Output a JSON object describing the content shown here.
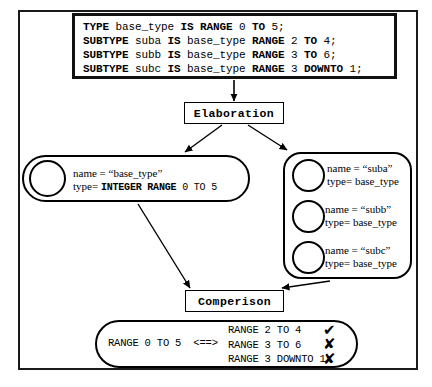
{
  "code_box": {
    "lines": [
      [
        {
          "t": "TYPE ",
          "b": true
        },
        {
          "t": "base_type ",
          "b": false
        },
        {
          "t": "IS RANGE ",
          "b": true
        },
        {
          "t": "0 ",
          "b": false
        },
        {
          "t": "TO ",
          "b": true
        },
        {
          "t": "5;",
          "b": false
        }
      ],
      [
        {
          "t": "SUBTYPE ",
          "b": true
        },
        {
          "t": "suba ",
          "b": false
        },
        {
          "t": "IS ",
          "b": true
        },
        {
          "t": "base_type ",
          "b": false
        },
        {
          "t": "RANGE ",
          "b": true
        },
        {
          "t": "2 ",
          "b": false
        },
        {
          "t": "TO ",
          "b": true
        },
        {
          "t": "4;",
          "b": false
        }
      ],
      [
        {
          "t": "SUBTYPE ",
          "b": true
        },
        {
          "t": "subb ",
          "b": false
        },
        {
          "t": "IS ",
          "b": true
        },
        {
          "t": "base_type ",
          "b": false
        },
        {
          "t": "RANGE ",
          "b": true
        },
        {
          "t": "3 ",
          "b": false
        },
        {
          "t": "TO ",
          "b": true
        },
        {
          "t": "6;",
          "b": false
        }
      ],
      [
        {
          "t": "SUBTYPE ",
          "b": true
        },
        {
          "t": "subc ",
          "b": false
        },
        {
          "t": "IS ",
          "b": true
        },
        {
          "t": "base_type ",
          "b": false
        },
        {
          "t": "RANGE ",
          "b": true
        },
        {
          "t": "3 ",
          "b": false
        },
        {
          "t": "DOWNTO ",
          "b": true
        },
        {
          "t": "1;",
          "b": false
        }
      ]
    ]
  },
  "process": {
    "elaboration_label": "Elaboration",
    "comparison_label": "Comperison"
  },
  "base_type_object": {
    "name_line": "name = “base_type”",
    "type_prefix": "type= ",
    "type_keyword": "INTEGER RANGE",
    "type_value": " 0 TO 5"
  },
  "subtype_objects": [
    {
      "name_line": "name = “suba”",
      "type_line": "type= base_type"
    },
    {
      "name_line": "name = “subb”",
      "type_line": "type= base_type"
    },
    {
      "name_line": "name = “subc”",
      "type_line": "type= base_type"
    }
  ],
  "result": {
    "left_operand": "RANGE 0 TO 5",
    "operator": "<==>",
    "comparisons": [
      {
        "range": "RANGE 2 TO 4",
        "verdict": "✔",
        "match": true
      },
      {
        "range": "RANGE 3 TO 6",
        "verdict": "✘",
        "match": false
      },
      {
        "range": "RANGE 3 DOWNTO 1",
        "verdict": "✘",
        "match": false
      }
    ]
  },
  "colors": {
    "ink": "#000000",
    "frame": "#1a1a1a",
    "paper": "#ffffff"
  }
}
